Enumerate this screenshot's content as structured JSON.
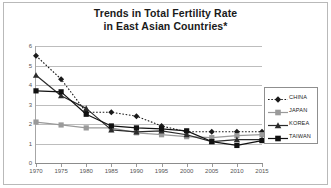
{
  "chart_data": {
    "type": "line",
    "title": "Trends in Total Fertility Rate in East Asian Countries*",
    "title_line1": "Trends in Total Fertility Rate",
    "title_line2": "in East Asian Countries*",
    "xlabel": "",
    "ylabel": "Children per woman",
    "x": [
      1970,
      1975,
      1980,
      1985,
      1990,
      1995,
      2000,
      2005,
      2010,
      2015
    ],
    "categories": [
      "1970",
      "1975",
      "1980",
      "1985",
      "1990",
      "1995",
      "2000",
      "2005",
      "2010",
      "2015"
    ],
    "ylim": [
      0,
      6
    ],
    "yticks": [
      0,
      1,
      2,
      3,
      4,
      5,
      6
    ],
    "ytick_labels": [
      "0",
      "1",
      "2",
      "3",
      "4",
      "5",
      "6"
    ],
    "xlim": [
      1970,
      2015
    ],
    "grid": true,
    "legend_position": "right",
    "series": [
      {
        "name": "CHINA",
        "color": "#1a1a1a",
        "line_style": "dotted",
        "marker": "diamond",
        "values": [
          5.5,
          4.3,
          2.6,
          2.6,
          2.4,
          1.9,
          1.6,
          1.6,
          1.6,
          1.6
        ]
      },
      {
        "name": "JAPAN",
        "color": "#9a9a9a",
        "line_style": "solid",
        "marker": "square",
        "values": [
          2.1,
          1.95,
          1.8,
          1.8,
          1.55,
          1.45,
          1.35,
          1.3,
          1.4,
          1.45
        ]
      },
      {
        "name": "KOREA",
        "color": "#2b2b2b",
        "line_style": "solid",
        "marker": "triangle",
        "values": [
          4.5,
          3.45,
          2.8,
          1.7,
          1.6,
          1.65,
          1.45,
          1.1,
          1.2,
          1.2
        ]
      },
      {
        "name": "TAIWAN",
        "color": "#111111",
        "line_style": "solid",
        "marker": "square",
        "values": [
          3.7,
          3.65,
          2.5,
          1.9,
          1.8,
          1.75,
          1.65,
          1.1,
          0.9,
          1.15
        ]
      }
    ]
  }
}
